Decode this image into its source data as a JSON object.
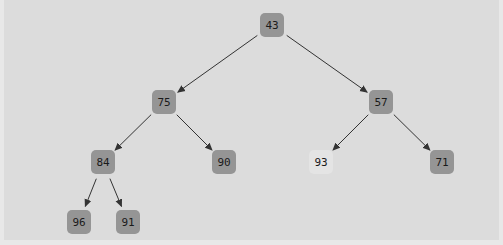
{
  "diagram": {
    "type": "binary-tree",
    "colors": {
      "background": "#dcdcdc",
      "node_fill": "#959595",
      "node_highlight_fill": "#e4e4e4",
      "edge": "#333333",
      "text": "#1a1a1a"
    },
    "nodes": [
      {
        "id": "n43",
        "label": "43",
        "x": 272,
        "y": 25,
        "highlight": false
      },
      {
        "id": "n75",
        "label": "75",
        "x": 164,
        "y": 102,
        "highlight": false
      },
      {
        "id": "n57",
        "label": "57",
        "x": 381,
        "y": 102,
        "highlight": false
      },
      {
        "id": "n84",
        "label": "84",
        "x": 103,
        "y": 162,
        "highlight": false
      },
      {
        "id": "n90",
        "label": "90",
        "x": 224,
        "y": 162,
        "highlight": false
      },
      {
        "id": "n93",
        "label": "93",
        "x": 321,
        "y": 162,
        "highlight": true
      },
      {
        "id": "n71",
        "label": "71",
        "x": 442,
        "y": 162,
        "highlight": false
      },
      {
        "id": "n96",
        "label": "96",
        "x": 79,
        "y": 222,
        "highlight": false
      },
      {
        "id": "n91",
        "label": "91",
        "x": 128,
        "y": 222,
        "highlight": false
      }
    ],
    "edges": [
      {
        "from": "n43",
        "to": "n75"
      },
      {
        "from": "n43",
        "to": "n57"
      },
      {
        "from": "n75",
        "to": "n84"
      },
      {
        "from": "n75",
        "to": "n90"
      },
      {
        "from": "n57",
        "to": "n93"
      },
      {
        "from": "n57",
        "to": "n71"
      },
      {
        "from": "n84",
        "to": "n96"
      },
      {
        "from": "n84",
        "to": "n91"
      }
    ]
  }
}
